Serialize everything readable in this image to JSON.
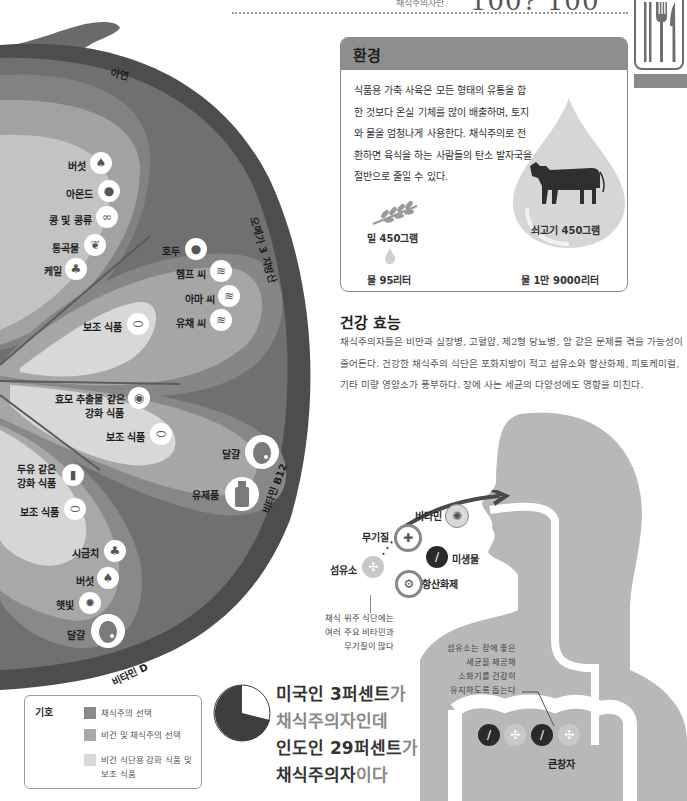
{
  "header": {
    "subtitle": "채식주의자란",
    "page_range": "100? 100",
    "icon": "cutlery-icon"
  },
  "colors": {
    "outer_ring": "#4a4a4a",
    "ring_mid": "#6f6f6f",
    "petal_dark": "#8a8a8a",
    "petal_mid": "#a9a9a9",
    "petal_light": "#d2d2d2",
    "env_header": "#8e8e8e",
    "body_silhouette": "#b8b8b8"
  },
  "diagram": {
    "rings": {
      "zinc": "아연",
      "omega3": "오메가 3 지방산",
      "b12": "비타민 B12",
      "vitd": "비타민 D"
    },
    "zinc_items": [
      "버섯",
      "아몬드",
      "콩 및 콩류",
      "통곡물",
      "케일"
    ],
    "omega_items": [
      "호두",
      "헴프 씨",
      "아마 씨",
      "유채 씨"
    ],
    "omega_supplement": "보조 식품",
    "b12_fortified_line1": "효모 추출물 같은",
    "b12_fortified_line2": "강화 식품",
    "b12_supplement": "보조 식품",
    "b12_egg": "달걀",
    "b12_dairy": "유제품",
    "vitd_fortified_line1": "두유 같은",
    "vitd_fortified_line2": "강화 식품",
    "vitd_supplement": "보조 식품",
    "vitd_items": [
      "시금치",
      "버섯",
      "햇빛"
    ],
    "vitd_egg": "달걀"
  },
  "environment": {
    "title": "환경",
    "text": "식품용 가축 사육은 모든 형태의 유통을 합한 것보다 온실 기체를 많이 배출하며, 토지와 물을 엄청나게 사용한다. 채식주의로 전환하면 육식을 하는 사람들의 탄소 발자국을 절반으로 줄일 수 있다.",
    "wheat_label": "밀 450그램",
    "wheat_water": "물 95리터",
    "beef_label": "쇠고기 450그램",
    "beef_water": "물 1만 9000리터"
  },
  "health": {
    "title": "건강 효능",
    "text": "채식주의자들은 비만과 심장병, 고혈압, 제2형 당뇨병, 암 같은 문제를 겪을 가능성이 줄어든다. 건강한 채식주의 식단은 포화지방이 적고 섬유소와 항산화제, 피토케미컬, 기타 미량 영양소가 풍부하다. 장에 사는 세균의 다양성에도 영향을 미친다."
  },
  "nutrients": {
    "vitamin": "비타민",
    "mineral": "무기질",
    "microbe": "미생물",
    "fiber": "섬유소",
    "antioxidant": "항산화제"
  },
  "notes": {
    "diet_line1": "채식 위주 식단에는",
    "diet_line2": "여러 주요 비타민과",
    "diet_line3": "무기질이 많다",
    "fiber_line1": "섬유소는 장에 좋은",
    "fiber_line2": "세균을 제공해",
    "fiber_line3": "소화기를 건강히",
    "fiber_line4": "유지하도록 돕는다",
    "colon": "큰창자"
  },
  "legend": {
    "title": "기호",
    "items": [
      {
        "label": "채식주의 선택",
        "color": "#8a8a8a"
      },
      {
        "label": "비건 및 채식주의 선택",
        "color": "#a9a9a9"
      },
      {
        "label": "비건 식단용 강화 식품 및",
        "label2": "보조 식품",
        "color": "#d9d9d9"
      }
    ]
  },
  "stat": {
    "line1_bold": "미국인 3퍼센트",
    "line1_rest": "가",
    "line2": "채식주의자인데",
    "line3_bold": "인도인 29퍼센트",
    "line3_rest": "가",
    "line4_bold": "채식주의자",
    "line4_rest": "이다",
    "pie_percent": 29
  }
}
